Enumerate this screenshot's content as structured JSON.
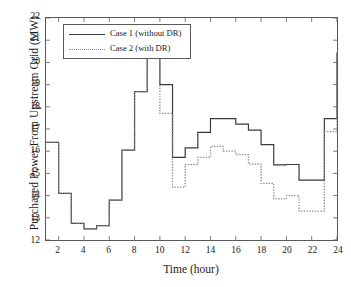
{
  "chart_data": {
    "type": "line",
    "title": "",
    "xlabel": "Time (hour)",
    "ylabel": "Purchased Power From Upstream Grid (MW)",
    "xlim": [
      1,
      24
    ],
    "ylim": [
      12,
      22
    ],
    "xticks": [
      2,
      4,
      6,
      8,
      10,
      12,
      14,
      16,
      18,
      20,
      22,
      24
    ],
    "yticks": [
      12,
      13,
      14,
      15,
      16,
      17,
      18,
      19,
      20,
      21,
      22
    ],
    "grid": false,
    "step_style": "post",
    "legend_position": "upper-left",
    "x": [
      1,
      2,
      3,
      4,
      5,
      6,
      7,
      8,
      9,
      10,
      11,
      12,
      13,
      14,
      15,
      16,
      17,
      18,
      19,
      20,
      21,
      22,
      23,
      24
    ],
    "series": [
      {
        "name": "Case 1 (without DR)",
        "style": "solid",
        "color": "#3a3a3a",
        "values": [
          16.4,
          14.1,
          12.75,
          12.5,
          12.65,
          13.8,
          16.05,
          18.68,
          20.48,
          19.0,
          15.72,
          16.15,
          16.85,
          17.47,
          17.47,
          17.22,
          16.95,
          16.3,
          15.38,
          15.4,
          14.7,
          14.7,
          17.47,
          20.45
        ]
      },
      {
        "name": "Case 2 (with DR)",
        "style": "dotted",
        "color": "#8a8a8a",
        "values": [
          16.4,
          14.1,
          12.75,
          12.5,
          12.65,
          13.8,
          16.05,
          18.68,
          20.48,
          17.7,
          14.38,
          15.4,
          15.72,
          16.22,
          16.0,
          15.85,
          15.42,
          14.55,
          13.85,
          14.0,
          13.3,
          13.3,
          16.88,
          19.85
        ]
      }
    ]
  },
  "legend": {
    "items": [
      {
        "label": "Case 1 (without DR)"
      },
      {
        "label": "Case 2 (with DR)"
      }
    ]
  },
  "axes": {
    "y_tick_labels": [
      "22",
      "21",
      "20",
      "19",
      "18",
      "17",
      "16",
      "15",
      "14",
      "13",
      "12"
    ],
    "x_tick_labels": [
      "2",
      "4",
      "6",
      "8",
      "10",
      "12",
      "14",
      "16",
      "18",
      "20",
      "22",
      "24"
    ]
  }
}
